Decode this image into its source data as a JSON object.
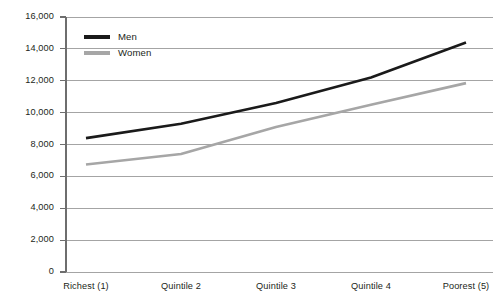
{
  "chart_data": {
    "type": "line",
    "title": "",
    "subtitle": "",
    "xlabel": "",
    "ylabel": "",
    "categories": [
      "Richest (1)",
      "Quintile 2",
      "Quintile 3",
      "Quintile 4",
      "Poorest (5)"
    ],
    "series": [
      {
        "name": "Men",
        "color": "#1a1a1a",
        "values": [
          8400,
          9300,
          10600,
          12200,
          14400
        ]
      },
      {
        "name": "Women",
        "color": "#a6a6a6",
        "values": [
          6750,
          7400,
          9100,
          10500,
          11850
        ]
      }
    ],
    "ylim": [
      0,
      16000
    ],
    "ytick_values": [
      0,
      2000,
      4000,
      6000,
      8000,
      10000,
      12000,
      14000,
      16000
    ],
    "ytick_labels": [
      "0",
      "2,000",
      "4,000",
      "6,000",
      "8,000",
      "10,000",
      "12,000",
      "14,000",
      "16,000"
    ],
    "grid": true,
    "grid_axis": "y",
    "legend_position": "top-left",
    "background_color": "#ffffff",
    "gridline_color": "#9a9a9a",
    "axis_color": "#6e6e6e"
  },
  "legend": {
    "entries": [
      {
        "label": "Men"
      },
      {
        "label": "Women"
      }
    ]
  }
}
